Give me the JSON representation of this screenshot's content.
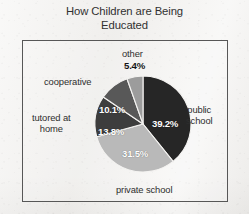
{
  "chart_data": {
    "type": "pie",
    "title": "How Children are Being Educated",
    "title_line1": "How Children are Being",
    "title_line2": "Educated",
    "categories": [
      "public school",
      "private school",
      "tutored at home",
      "cooperative",
      "other"
    ],
    "values": [
      39.2,
      31.5,
      13.8,
      10.1,
      5.4
    ],
    "value_labels": [
      "39.2%",
      "31.5%",
      "13.8%",
      "10.1%",
      "5.4%"
    ],
    "units": "percent",
    "start_angle_deg": 0,
    "direction": "clockwise",
    "legend": "none",
    "grid": false,
    "slice_colors": [
      "#262626",
      "#b9b9b9",
      "#3d3d3d",
      "#585858",
      "#9c9c9c"
    ],
    "slice_edge_color": "#f4f3f1",
    "xlabel": "",
    "ylabel": ""
  },
  "figure": {
    "background_color": "#f2f1ef",
    "frame_color": "#575757",
    "text_color": "#2e2e2e"
  },
  "pie_geometry": {
    "center_x": 143,
    "center_y": 124,
    "radius": 48
  },
  "slice_label_positions": [
    {
      "text": "39.2%",
      "x": 152,
      "y": 118
    },
    {
      "text": "31.5%",
      "x": 122,
      "y": 148
    },
    {
      "text": "13.8%",
      "x": 98,
      "y": 126
    },
    {
      "text": "10.1%",
      "x": 99,
      "y": 104
    },
    {
      "text": "5.4%",
      "x": 124,
      "y": 60
    }
  ],
  "category_label_positions": [
    {
      "text": "other",
      "x": 122,
      "y": 48
    },
    {
      "text": "public school",
      "x": 186,
      "y": 104,
      "lines": [
        "public",
        "school"
      ]
    },
    {
      "text": "private school",
      "x": 116,
      "y": 184
    },
    {
      "text": "tutored at home",
      "x": 32,
      "y": 112,
      "lines": [
        "tutored at",
        "home"
      ]
    },
    {
      "text": "cooperative",
      "x": 44,
      "y": 76
    }
  ]
}
